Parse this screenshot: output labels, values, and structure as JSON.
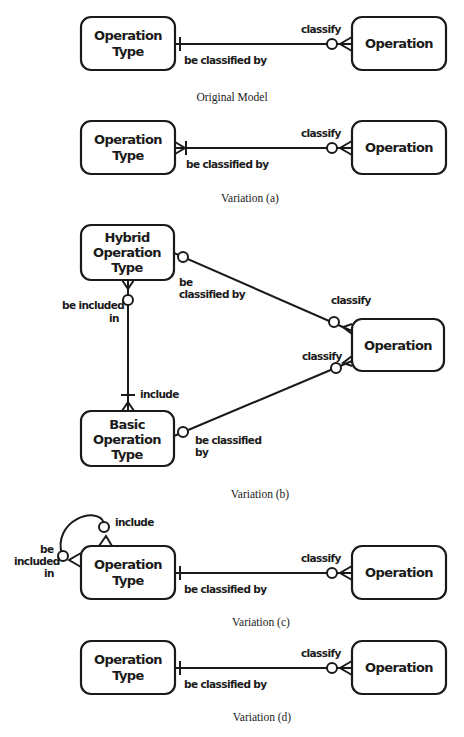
{
  "diagrams": {
    "original": {
      "caption": "Original Model",
      "entity_left": [
        "Operation",
        "Type"
      ],
      "entity_right": "Operation",
      "label_left": "be classified by",
      "label_right": "classify"
    },
    "a": {
      "caption": "Variation (a)",
      "entity_left": [
        "Operation",
        "Type"
      ],
      "entity_right": "Operation",
      "label_left": "be classified by",
      "label_right": "classify"
    },
    "b": {
      "caption": "Variation (b)",
      "entity_hybrid": [
        "Hybrid",
        "Operation",
        "Type"
      ],
      "entity_basic": [
        "Basic",
        "Operation",
        "Type"
      ],
      "entity_right": "Operation",
      "label_hybrid_classified": [
        "be",
        "classified by"
      ],
      "label_basic_classified": [
        "be classified",
        "by"
      ],
      "label_classify_top": "classify",
      "label_classify_bottom": "classify",
      "label_included_in": [
        "be included",
        "in"
      ],
      "label_include": "include"
    },
    "c": {
      "caption": "Variation (c)",
      "entity_left": [
        "Operation",
        "Type"
      ],
      "entity_right": "Operation",
      "label_left": "be classified by",
      "label_right": "classify",
      "label_include": "include",
      "label_included_in": [
        "be",
        "included",
        "in"
      ]
    },
    "d": {
      "caption": "Variation (d)",
      "entity_left": [
        "Operation",
        "Type"
      ],
      "entity_right": "Operation",
      "label_left": "be classified by",
      "label_right": "classify"
    }
  }
}
